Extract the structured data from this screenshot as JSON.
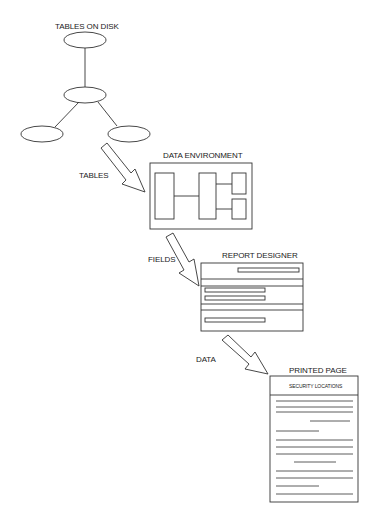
{
  "diagram": {
    "nodes": {
      "tables_on_disk": {
        "label": "TABLES ON DISK"
      },
      "data_environment": {
        "label": "DATA ENVIRONMENT"
      },
      "report_designer": {
        "label": "REPORT DESIGNER"
      },
      "printed_page": {
        "label": "PRINTED PAGE",
        "header": "SECURITY LOCATIONS"
      }
    },
    "arrows": [
      {
        "label": "TABLES",
        "from": "tables_on_disk",
        "to": "data_environment"
      },
      {
        "label": "FIELDS",
        "from": "data_environment",
        "to": "report_designer"
      },
      {
        "label": "DATA",
        "from": "report_designer",
        "to": "printed_page"
      }
    ],
    "colors": {
      "stroke": "#333333",
      "background": "#ffffff"
    }
  }
}
